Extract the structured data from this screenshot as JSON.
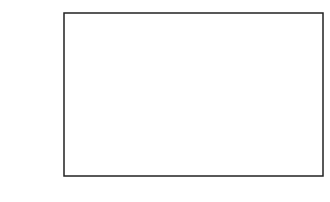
{
  "chart_data": {
    "type": "bar",
    "title": "",
    "xlabel": "",
    "ylabel": "% of Positive Responses",
    "categories": [
      "Lowest Third",
      "Middle Third",
      "Highest Third"
    ],
    "values": [
      10,
      13,
      21
    ],
    "data_labels": [
      "10",
      "13",
      "21"
    ],
    "ylim": [
      0,
      100
    ],
    "yticks": [
      0,
      10,
      20,
      30,
      40,
      50,
      60,
      70,
      80,
      90,
      100
    ],
    "grid": false,
    "legend": null,
    "bar_color": "#555555"
  }
}
